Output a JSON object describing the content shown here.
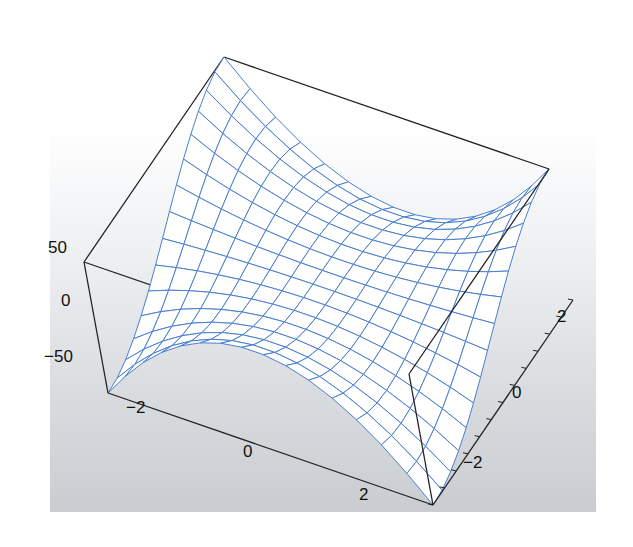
{
  "chart_data": {
    "type": "surface3d",
    "title": "",
    "function_description": "wireframe surface with rising ridges along back (high y) and a peak near front (low y), saddle-like shape",
    "x": {
      "label": "",
      "range": [
        -3,
        3
      ],
      "ticks": [
        -2,
        0,
        2
      ],
      "tick_labels": [
        "−2",
        "0",
        "2"
      ]
    },
    "y": {
      "label": "",
      "range": [
        -3,
        3
      ],
      "ticks": [
        -2,
        0,
        2
      ],
      "tick_labels": [
        "−2",
        "0",
        "2"
      ]
    },
    "z": {
      "label": "",
      "range": [
        -75,
        75
      ],
      "ticks": [
        50,
        0,
        -50
      ],
      "tick_labels": [
        "50",
        "0",
        "−50"
      ]
    },
    "mesh": {
      "rows": 15,
      "cols": 15
    },
    "grid": false,
    "legend": null,
    "colors": {
      "mesh": "#4a7fcf",
      "box": "#222222",
      "surface": "#ffffff",
      "background_top": "#ffffff",
      "background_bottom": "#c9cdd1"
    }
  }
}
